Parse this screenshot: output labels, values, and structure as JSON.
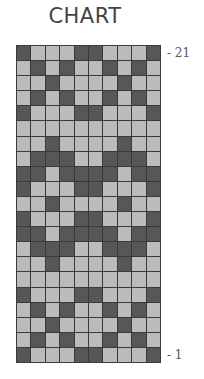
{
  "title": "CHART",
  "colors": {
    "dark": "#575757",
    "light": "#bcbcbc",
    "gridline": "#3a3a3a"
  },
  "grid": {
    "columns": 10,
    "rows": 21,
    "row_labels": [
      {
        "row": 21,
        "text": "- 21"
      },
      {
        "row": 1,
        "text": "- 1"
      }
    ],
    "rows_top_to_bottom": [
      {
        "row": 21,
        "pattern": "DLLLDDLLLD"
      },
      {
        "row": 20,
        "pattern": "LDLDLLDLDL"
      },
      {
        "row": 19,
        "pattern": "LLDLLLLDLL"
      },
      {
        "row": 18,
        "pattern": "LDLDLLDLDL"
      },
      {
        "row": 17,
        "pattern": "DLLLDDLLLD"
      },
      {
        "row": 16,
        "pattern": "LLLLLLLLLL"
      },
      {
        "row": 15,
        "pattern": "LLDLLLLDLL"
      },
      {
        "row": 14,
        "pattern": "LDDDLLDDDL"
      },
      {
        "row": 13,
        "pattern": "DDLDDDDLDD"
      },
      {
        "row": 12,
        "pattern": "DLLLDDLLLD"
      },
      {
        "row": 11,
        "pattern": "LLDLLLLDLL"
      },
      {
        "row": 10,
        "pattern": "DLLLDDLLLD"
      },
      {
        "row": 9,
        "pattern": "DDLDDDDLDD"
      },
      {
        "row": 8,
        "pattern": "LDDDLLDDDL"
      },
      {
        "row": 7,
        "pattern": "LLDLLLLDLL"
      },
      {
        "row": 6,
        "pattern": "LLLLLLLLLL"
      },
      {
        "row": 5,
        "pattern": "DLLLDDLLLD"
      },
      {
        "row": 4,
        "pattern": "LDLDLLDLDL"
      },
      {
        "row": 3,
        "pattern": "LLDLLLLDLL"
      },
      {
        "row": 2,
        "pattern": "LDLDLLDLDL"
      },
      {
        "row": 1,
        "pattern": "DLLLDDLLLD"
      }
    ]
  }
}
